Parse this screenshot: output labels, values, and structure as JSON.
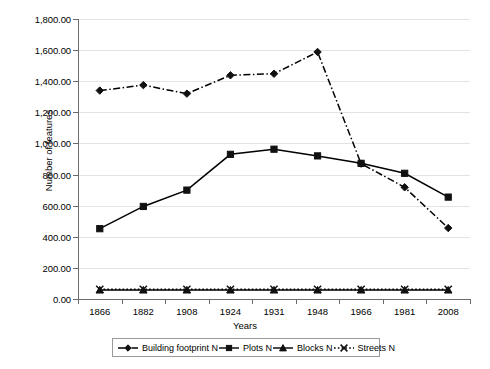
{
  "chart_data": {
    "type": "line",
    "title": "",
    "xlabel": "Years",
    "ylabel": "Number of features",
    "categories": [
      "1866",
      "1882",
      "1908",
      "1924",
      "1931",
      "1948",
      "1966",
      "1981",
      "2008"
    ],
    "ylim": [
      0,
      1800
    ],
    "ytick_labels": [
      "0.00",
      "200.00",
      "400.00",
      "600.00",
      "800.00",
      "1,000.00",
      "1,200.00",
      "1,400.00",
      "1,600.00",
      "1,800.00"
    ],
    "ytick_values": [
      0,
      200,
      400,
      600,
      800,
      1000,
      1200,
      1400,
      1600,
      1800
    ],
    "grid": true,
    "legend_position": "bottom",
    "series": [
      {
        "name": "Building footprint N",
        "marker": "diamond",
        "line_style": "dash-dot",
        "color": "#000000",
        "values": [
          1340,
          1375,
          1320,
          1438,
          1448,
          1588,
          870,
          718,
          456
        ]
      },
      {
        "name": "Plots N",
        "marker": "square",
        "line_style": "solid",
        "color": "#000000",
        "values": [
          452,
          595,
          700,
          930,
          963,
          920,
          872,
          808,
          655
        ]
      },
      {
        "name": "Blocks N",
        "marker": "triangle",
        "line_style": "solid",
        "color": "#000000",
        "values": [
          58,
          58,
          58,
          58,
          58,
          58,
          58,
          58,
          58
        ]
      },
      {
        "name": "Streets N",
        "marker": "x",
        "line_style": "dotted",
        "color": "#000000",
        "values": [
          62,
          62,
          62,
          62,
          62,
          62,
          62,
          62,
          62
        ]
      }
    ]
  }
}
